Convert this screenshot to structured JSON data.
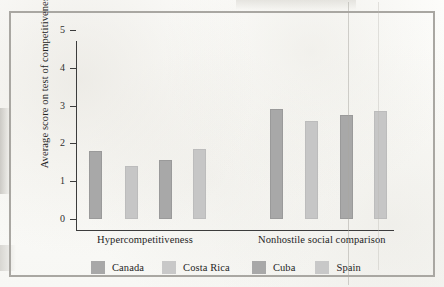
{
  "chart_data": {
    "type": "bar",
    "title": "",
    "xlabel": "",
    "ylabel": "Average score on test of competitiveness",
    "ylim": [
      0,
      5
    ],
    "yticks": [
      "0",
      "1",
      "2",
      "3",
      "4",
      "5"
    ],
    "grid": false,
    "legend_position": "bottom",
    "categories": [
      "Hypercompetitiveness",
      "Nonhostile social comparison"
    ],
    "series": [
      {
        "name": "Canada",
        "color": "#a8a8a8",
        "values": [
          1.8,
          2.9
        ]
      },
      {
        "name": "Costa Rica",
        "color": "#c8c8c8",
        "values": [
          1.4,
          2.6
        ]
      },
      {
        "name": "Cuba",
        "color": "#a8a8a8",
        "values": [
          1.55,
          2.75
        ]
      },
      {
        "name": "Spain",
        "color": "#c8c8c8",
        "values": [
          1.85,
          2.85
        ]
      }
    ]
  },
  "legend": {
    "items": [
      {
        "label": "Canada",
        "tone": "dark"
      },
      {
        "label": "Costa Rica",
        "tone": "light"
      },
      {
        "label": "Cuba",
        "tone": "dark"
      },
      {
        "label": "Spain",
        "tone": "light"
      }
    ]
  }
}
